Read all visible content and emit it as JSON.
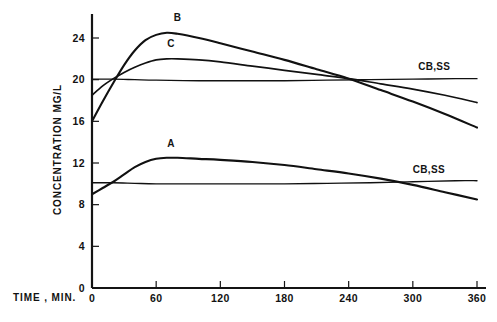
{
  "chart_data": {
    "type": "line",
    "title": "",
    "xlabel": "TIME , MIN.",
    "ylabel": "CONCENTRATION MG/L",
    "xlim": [
      0,
      360
    ],
    "ylim": [
      0,
      26
    ],
    "xticks": [
      0,
      60,
      120,
      180,
      240,
      300,
      360
    ],
    "yticks": [
      0,
      4,
      8,
      12,
      16,
      20,
      24
    ],
    "xtick_labels": [
      "0",
      "60",
      "120",
      "180",
      "240",
      "300",
      "360"
    ],
    "ytick_labels": [
      "0",
      "4",
      "8",
      "12",
      "16",
      "20",
      "24"
    ],
    "grid": false,
    "legend_position": "inline-annotations",
    "series": [
      {
        "name": "B",
        "label": "B",
        "label_x": 80,
        "label_y": 25.6,
        "x": [
          0,
          10,
          20,
          30,
          40,
          50,
          60,
          70,
          80,
          100,
          120,
          150,
          180,
          210,
          240,
          270,
          300,
          330,
          360
        ],
        "values": [
          16.0,
          17.9,
          19.7,
          21.4,
          22.8,
          23.8,
          24.3,
          24.5,
          24.4,
          24.0,
          23.5,
          22.7,
          21.9,
          21.0,
          20.1,
          19.0,
          17.9,
          16.7,
          15.4
        ]
      },
      {
        "name": "C",
        "label": "C",
        "label_x": 74,
        "label_y": 23.1,
        "x": [
          0,
          10,
          20,
          30,
          40,
          50,
          60,
          70,
          80,
          100,
          120,
          150,
          180,
          210,
          240,
          270,
          300,
          330,
          360
        ],
        "values": [
          18.5,
          19.4,
          20.1,
          20.7,
          21.2,
          21.6,
          21.9,
          22.0,
          22.0,
          21.9,
          21.7,
          21.3,
          20.9,
          20.5,
          20.1,
          19.6,
          19.1,
          18.5,
          17.8
        ]
      },
      {
        "name": "CB,SS upper",
        "label": "CB,SS",
        "label_x": 305,
        "label_y": 20.9,
        "x": [
          0,
          20,
          40,
          60,
          100,
          140,
          180,
          220,
          260,
          300,
          340,
          360
        ],
        "values": [
          20.05,
          20.05,
          20.0,
          19.95,
          19.9,
          19.9,
          19.9,
          19.95,
          20.0,
          20.05,
          20.1,
          20.1
        ]
      },
      {
        "name": "A",
        "label": "A",
        "label_x": 74,
        "label_y": 13.5,
        "x": [
          0,
          10,
          20,
          30,
          40,
          50,
          60,
          70,
          80,
          100,
          120,
          150,
          180,
          210,
          240,
          270,
          300,
          330,
          360
        ],
        "values": [
          9.0,
          9.6,
          10.2,
          10.9,
          11.6,
          12.1,
          12.4,
          12.5,
          12.5,
          12.4,
          12.3,
          12.1,
          11.8,
          11.4,
          11.0,
          10.5,
          9.9,
          9.2,
          8.5
        ]
      },
      {
        "name": "CB,SS lower",
        "label": "CB,SS",
        "label_x": 300,
        "label_y": 11.0,
        "x": [
          0,
          20,
          40,
          60,
          100,
          140,
          180,
          220,
          260,
          300,
          340,
          360
        ],
        "values": [
          10.1,
          10.1,
          10.05,
          10.0,
          10.0,
          10.0,
          10.0,
          10.05,
          10.1,
          10.2,
          10.3,
          10.3
        ]
      }
    ],
    "annotations": [
      {
        "text": "B",
        "x": 80,
        "y": 25.6
      },
      {
        "text": "C",
        "x": 74,
        "y": 23.1
      },
      {
        "text": "A",
        "x": 74,
        "y": 13.5
      },
      {
        "text": "CB,SS",
        "x": 305,
        "y": 20.9
      },
      {
        "text": "CB,SS",
        "x": 300,
        "y": 11.0
      }
    ]
  },
  "axes": {
    "y_title": "CONCENTRATION MG/L",
    "x_title": "TIME , MIN."
  }
}
